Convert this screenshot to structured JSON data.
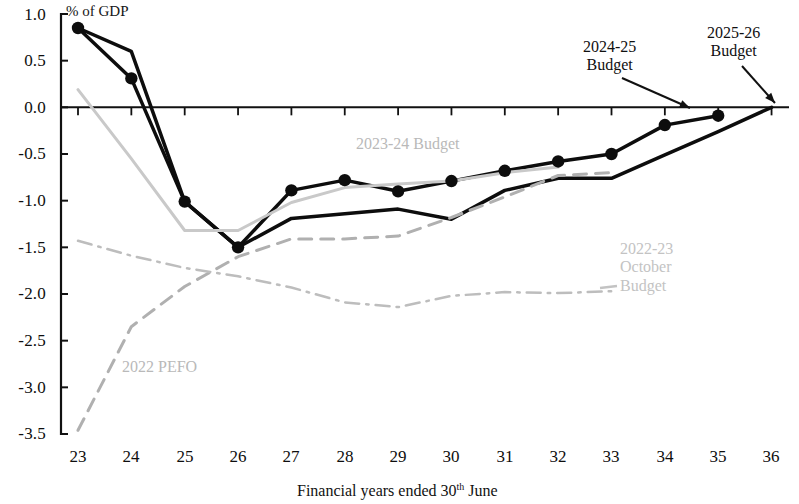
{
  "chart_data": {
    "type": "line",
    "title": "",
    "xlabel": "Financial years ended 30th June",
    "ylabel": "% of GDP",
    "unit_label": "% of GDP",
    "categories": [
      "23",
      "24",
      "25",
      "26",
      "27",
      "28",
      "29",
      "30",
      "31",
      "32",
      "33",
      "34",
      "35",
      "36"
    ],
    "x_tick_labels": [
      "23",
      "24",
      "25",
      "26",
      "27",
      "28",
      "29",
      "30",
      "31",
      "32",
      "33",
      "34",
      "35",
      "36"
    ],
    "y_tick_labels": [
      "1.0",
      "0.5",
      "0.0",
      "-0.5",
      "-1.0",
      "-1.5",
      "-2.0",
      "-2.5",
      "-3.0",
      "-3.5"
    ],
    "y_ticks": [
      1.0,
      0.5,
      0.0,
      -0.5,
      -1.0,
      -1.5,
      -2.0,
      -2.5,
      -3.0,
      -3.5
    ],
    "ylim": [
      -3.5,
      1.0
    ],
    "xlim": [
      23,
      36
    ],
    "grid": false,
    "legend_position": "inline-annotations",
    "zero_line": true,
    "series": [
      {
        "name": "2025-26 Budget",
        "style": "solid",
        "color": "#0d0d0d",
        "markers": true,
        "width": 3.5,
        "x": [
          23,
          24,
          25,
          26,
          27,
          28,
          29,
          30,
          31,
          32,
          33,
          34,
          35
        ],
        "values": [
          0.85,
          0.31,
          -1.01,
          -1.5,
          -0.89,
          -0.78,
          -0.9,
          -0.79,
          -0.68,
          -0.58,
          -0.5,
          -0.19,
          -0.09
        ]
      },
      {
        "name": "2024-25 Budget",
        "style": "solid",
        "color": "#0d0d0d",
        "markers": false,
        "width": 3.5,
        "x": [
          23,
          24,
          25,
          26,
          27,
          28,
          29,
          30,
          31,
          32,
          33,
          34,
          35,
          36
        ],
        "values": [
          0.85,
          0.6,
          -1.01,
          -1.5,
          -1.19,
          -1.14,
          -1.09,
          -1.2,
          -0.89,
          -0.76,
          -0.76,
          -0.51,
          -0.26,
          0.0
        ]
      },
      {
        "name": "2023-24 Budget",
        "style": "solid",
        "color": "#c9c9c9",
        "markers": false,
        "width": 3.0,
        "x": [
          23,
          24,
          25,
          26,
          27,
          28,
          29,
          30,
          31,
          32
        ],
        "values": [
          0.19,
          -0.55,
          -1.32,
          -1.32,
          -1.02,
          -0.86,
          -0.82,
          -0.79,
          -0.7,
          -0.64
        ]
      },
      {
        "name": "2022 PEFO",
        "style": "dashed",
        "color": "#b0b0b0",
        "markers": false,
        "width": 3.0,
        "x": [
          23,
          24,
          25,
          26,
          27,
          28,
          29,
          30,
          31,
          32,
          33
        ],
        "values": [
          -3.46,
          -2.35,
          -1.92,
          -1.6,
          -1.41,
          -1.41,
          -1.38,
          -1.18,
          -0.96,
          -0.73,
          -0.7
        ]
      },
      {
        "name": "2022-23 October Budget",
        "style": "dash-dot",
        "color": "#bdbdbd",
        "markers": false,
        "width": 2.5,
        "x": [
          23,
          24,
          25,
          26,
          27,
          28,
          29,
          30,
          31,
          32,
          33
        ],
        "values": [
          -1.43,
          -1.59,
          -1.72,
          -1.81,
          -1.93,
          -2.09,
          -2.14,
          -2.02,
          -1.98,
          -1.99,
          -1.97
        ]
      }
    ],
    "annotations": [
      {
        "id": "ann-2023-24-budget",
        "text": "2023-24 Budget",
        "x": 433,
        "y": 143,
        "color": "#b9b9b9",
        "arrow": false
      },
      {
        "id": "ann-2024-25-budget",
        "text": "2024-25\nBudget",
        "line1": "2024-25",
        "line2": "Budget",
        "x": 634,
        "y": 46,
        "color": "#101010",
        "arrow": true
      },
      {
        "id": "ann-2025-26-budget",
        "text": "2025-26\nBudget",
        "line1": "2025-26",
        "line2": "Budget",
        "x": 753,
        "y": 32,
        "color": "#101010",
        "arrow": true
      },
      {
        "id": "ann-2022-23-october-budget",
        "line1": "2022-23",
        "line2": "October",
        "line3": "Budget",
        "x": 668,
        "y": 250,
        "color": "#c3c3c3",
        "arrow": false
      },
      {
        "id": "ann-2022-pefo",
        "text": "2022 PEFO",
        "x": 174,
        "y": 368,
        "color": "#b9b9b9",
        "arrow": false
      }
    ]
  },
  "axis": {
    "x_caption_pre": "Financial years ended 30",
    "x_caption_sup": "th",
    "x_caption_post": " June",
    "unit": "% of GDP"
  }
}
